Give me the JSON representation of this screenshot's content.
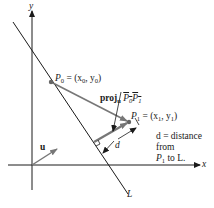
{
  "diagram": {
    "axes": {
      "x_label": "x",
      "y_label": "y"
    },
    "line_label": "L",
    "vector_u_label": "u",
    "point_p0": {
      "name": "P",
      "sub": "0",
      "coords_text": " = (x",
      "coord_x_sub": "0",
      "mid": ", y",
      "coord_y_sub": "0",
      "close": ")"
    },
    "point_p1": {
      "name": "P",
      "sub": "1",
      "coords_text": " = (x",
      "coord_x_sub": "1",
      "mid": ", y",
      "coord_y_sub": "1",
      "close": ")"
    },
    "projection_label": {
      "prefix": "proj",
      "sub": "u",
      "vec_start": "P",
      "vec_start_sub": "0",
      "vec_end": "P",
      "vec_end_sub": "1"
    },
    "distance_label": "d",
    "distance_note": {
      "line1": "d = distance",
      "line2": "from",
      "line3_prefix": "P",
      "line3_sub": "1",
      "line3_suffix": " to L."
    },
    "colors": {
      "axis": "#1a1a1a",
      "line_L": "#1a1a1a",
      "vector": "#7a7a7a",
      "point": "#6a6a6a"
    }
  }
}
